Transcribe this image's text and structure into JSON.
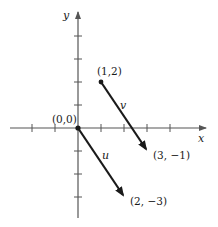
{
  "diagram": {
    "type": "coordinate-plane-vectors",
    "axes": {
      "x_label": "x",
      "y_label": "y",
      "x_ticks": [
        -3,
        -2,
        -1,
        1,
        2,
        3,
        4
      ],
      "y_ticks": [
        4,
        3,
        2,
        1,
        -1,
        -2,
        -3
      ]
    },
    "points": {
      "origin": "(0,0)",
      "v_start": "(1,2)",
      "v_end": "(3, −1)",
      "u_end": "(2, −3)"
    },
    "vectors": [
      {
        "name": "u",
        "from": [
          0,
          0
        ],
        "to": [
          2,
          -3
        ]
      },
      {
        "name": "v",
        "from": [
          1,
          2
        ],
        "to": [
          3,
          -1
        ]
      }
    ],
    "colors": {
      "axis": "#555555",
      "vector": "#1a1a1a",
      "background": "#ffffff"
    }
  }
}
